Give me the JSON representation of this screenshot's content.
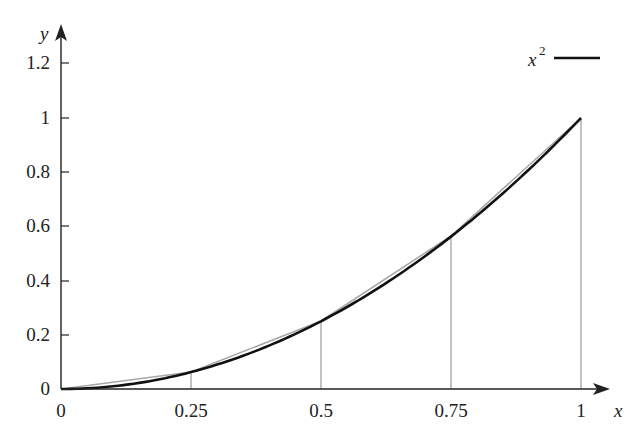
{
  "chart_data": {
    "type": "line",
    "title": "",
    "xlabel": "x",
    "ylabel": "y",
    "xlim": [
      0,
      1
    ],
    "ylim": [
      0,
      1.25
    ],
    "xticks": [
      "0",
      "0.25",
      "0.5",
      "0.75",
      "1"
    ],
    "yticks": [
      "0",
      "0.2",
      "0.4",
      "0.6",
      "0.8",
      "1",
      "1.2"
    ],
    "legend": {
      "position": "upper right",
      "entries": [
        "x^2"
      ]
    },
    "grid": false,
    "series": [
      {
        "name": "x^2",
        "style": "black thick curve",
        "x": [
          0,
          0.25,
          0.5,
          0.75,
          1
        ],
        "y": [
          0,
          0.0625,
          0.25,
          0.5625,
          1
        ]
      },
      {
        "name": "piecewise linear interpolation",
        "style": "gray thin polyline",
        "x": [
          0,
          0.25,
          0.5,
          0.75,
          1
        ],
        "y": [
          0,
          0.0625,
          0.25,
          0.5625,
          1
        ]
      }
    ],
    "annotations": [
      "vertical gray lines from x-axis to curve at x = 0.25, 0.5, 0.75, 1"
    ]
  },
  "labels": {
    "x_axis": "x",
    "y_axis": "y",
    "legend_base": "x",
    "legend_exp": "2",
    "xticks": [
      "0",
      "0.25",
      "0.5",
      "0.75",
      "1"
    ],
    "yticks": [
      "0",
      "0.2",
      "0.4",
      "0.6",
      "0.8",
      "1",
      "1.2"
    ]
  }
}
